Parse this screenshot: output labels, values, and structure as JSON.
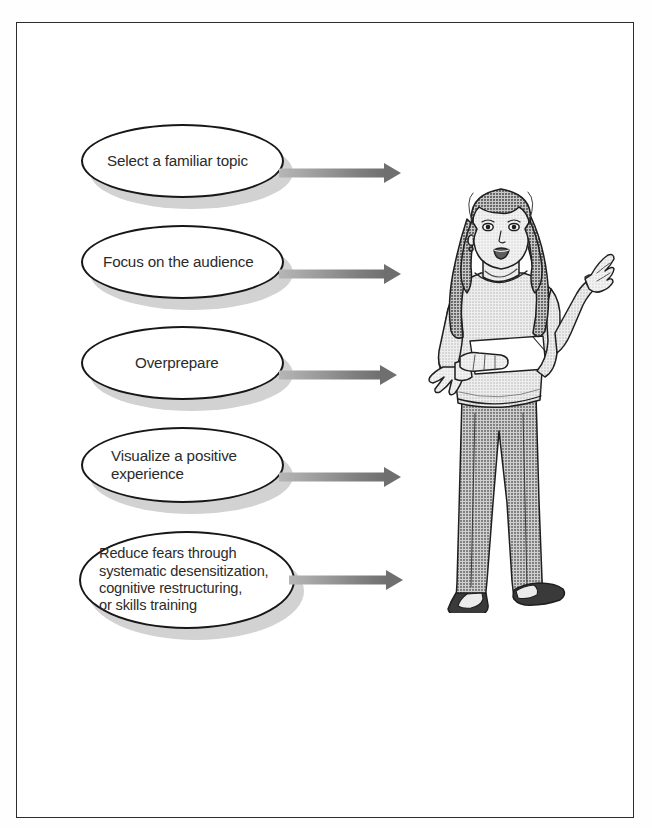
{
  "page": {
    "background_color": "#ffffff",
    "border_color": "#2c2c2c",
    "title": ""
  },
  "diagram": {
    "type": "flow-list",
    "orientation": "vertical-list-to-figure",
    "arrow_color": "#7e7e7e",
    "oval_fill": "#ffffff",
    "oval_outline": "#17171a",
    "oval_shadow": "#d2d2d2",
    "items": [
      {
        "index": 1,
        "label": "Select a familiar topic",
        "arrow": "right-arrow"
      },
      {
        "index": 2,
        "label": "Focus on the audience",
        "arrow": "right-arrow"
      },
      {
        "index": 3,
        "label": "Overprepare",
        "arrow": "right-arrow"
      },
      {
        "index": 4,
        "label": "Visualize a positive\nexperience",
        "arrow": "right-arrow"
      },
      {
        "index": 5,
        "label": "Reduce fears through\nsystematic desensitization,\ncognitive restructuring,\nor skills training",
        "arrow": "right-arrow"
      }
    ]
  },
  "illustration": {
    "name": "woman-speaking-with-note-card",
    "description": "Line-art halftone drawing of a young woman standing and speaking, holding a note card in one hand and gesturing with the other",
    "colors": {
      "skin": "#e2e2e2",
      "hair": "#8a8a8a",
      "top": "#dcdcdc",
      "trousers": "#9a9a9a",
      "shoes": "#3a3a3a",
      "note_card": "#ffffff",
      "outline": "#1f1f1f"
    }
  }
}
